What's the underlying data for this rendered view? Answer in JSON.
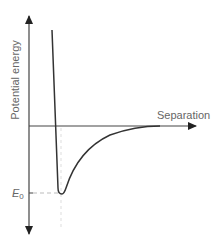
{
  "diagram": {
    "y_axis_label": "Potential energy",
    "x_axis_label": "Separation",
    "min_label_main": "E",
    "min_label_sub": "0",
    "colors": {
      "axis": "#333333",
      "curve": "#333333",
      "dashed": "#bbbbbb",
      "label": "#666666"
    }
  }
}
